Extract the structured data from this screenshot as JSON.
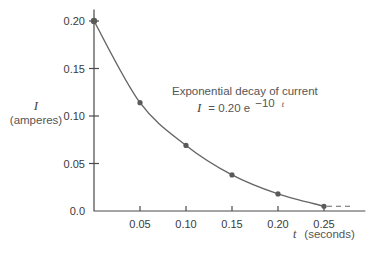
{
  "chart_data": {
    "type": "line",
    "title": "Exponential decay of current",
    "equation": {
      "lhs": "I",
      "rhs": "= 0.20 e",
      "exponent": "−10",
      "exponent_var": "t"
    },
    "xlabel": {
      "var": "t",
      "unit": "(seconds)"
    },
    "ylabel": {
      "var": "I",
      "unit": "(amperes)"
    },
    "xlim": [
      0,
      0.29
    ],
    "ylim": [
      0,
      0.21
    ],
    "xticks": [
      0.05,
      0.1,
      0.15,
      0.2,
      0.25
    ],
    "xtick_labels": [
      "0.05",
      "0.10",
      "0.15",
      "0.20",
      "0.25"
    ],
    "yticks": [
      0.0,
      0.05,
      0.1,
      0.15,
      0.2
    ],
    "ytick_labels": [
      "0.0",
      "0.05",
      "0.10",
      "0.15",
      "0.20"
    ],
    "grid": false,
    "series": [
      {
        "name": "I = 0.20 e^(-10t)",
        "x": [
          0.0,
          0.05,
          0.1,
          0.15,
          0.2,
          0.25
        ],
        "y": [
          0.2,
          0.114,
          0.069,
          0.038,
          0.018,
          0.005
        ]
      }
    ],
    "asymptote_dashed_from_x": 0.25,
    "asymptote_dashed_to_x": 0.28
  }
}
